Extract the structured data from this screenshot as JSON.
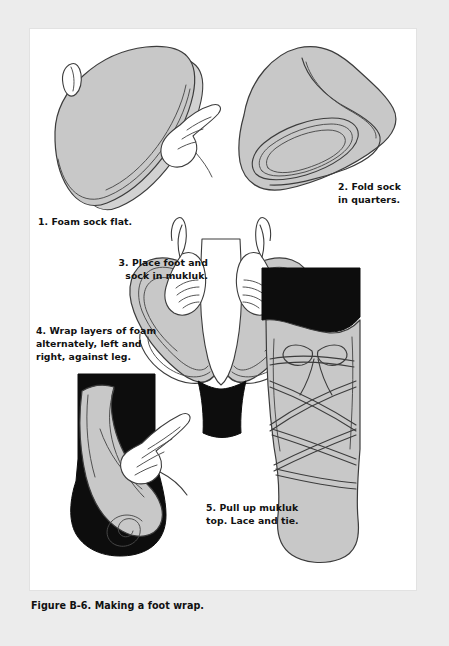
{
  "figure": {
    "caption": "Figure B-6. Making a foot wrap.",
    "steps": [
      {
        "number": "1",
        "text": "1. Foam sock flat."
      },
      {
        "number": "2",
        "text": "2. Fold sock\nin quarters."
      },
      {
        "number": "3",
        "text": "3. Place foot and\nsock in mukluk."
      },
      {
        "number": "4",
        "text": "4. Wrap layers of foam\nalternately, left and\nright, against leg."
      },
      {
        "number": "5",
        "text": "5. Pull up mukluk\ntop. Lace and tie."
      }
    ]
  },
  "colors": {
    "page_background": "#ececec",
    "panel_background": "#ffffff",
    "foam_gray": "#c8c8c8",
    "foam_gray_light": "#d4d4d4",
    "boot_black": "#0d0d0d",
    "skin": "#ffffff",
    "outline": "#3c3c3c",
    "text": "#111111"
  }
}
